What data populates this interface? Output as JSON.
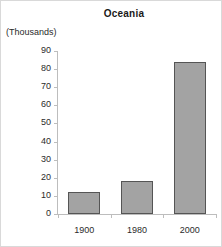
{
  "chart_data": {
    "type": "bar",
    "title": "Oceania",
    "units_label": "(Thousands)",
    "categories": [
      "1900",
      "1980",
      "2000"
    ],
    "values": [
      12,
      18,
      84
    ],
    "xlabel": "",
    "ylabel": "(Thousands)",
    "ylim": [
      0,
      90
    ],
    "ytick_step": 10,
    "yticks": [
      "90",
      "80",
      "70",
      "60",
      "50",
      "40",
      "30",
      "20",
      "10",
      "0"
    ],
    "grid": false,
    "legend": null,
    "colors": {
      "bar_fill": "#a3a3a3",
      "bar_border": "#555555",
      "axis": "#bdbdbd",
      "text": "#2b2b2b",
      "background": "#ffffff",
      "frame": "#d9d9d9"
    }
  }
}
